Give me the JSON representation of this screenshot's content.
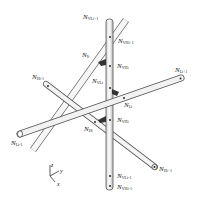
{
  "figure": {
    "type": "3d-woven-lattice-node-diagram",
    "colors": {
      "rod_fill": "#f2f2f2",
      "rod_edge": "#555555",
      "connector": "#333333",
      "node_dot": "#111111",
      "text": "#222222"
    },
    "nodes": [
      {
        "id": "vli_plus",
        "base": "N",
        "sub": "VLi+1"
      },
      {
        "id": "vhi_plus",
        "base": "N",
        "sub": "VHi+1"
      },
      {
        "id": "li",
        "base": "N",
        "sub": "Ii"
      },
      {
        "id": "vhi",
        "base": "N",
        "sub": "VHi"
      },
      {
        "id": "vli",
        "base": "N",
        "sub": "VLi"
      },
      {
        "id": "hi_minus",
        "base": "N",
        "sub": "Hi-1"
      },
      {
        "id": "li_plus",
        "base": "N",
        "sub": "Li+1"
      },
      {
        "id": "lj",
        "base": "N",
        "sub": "Li"
      },
      {
        "id": "vhi_b",
        "base": "N",
        "sub": "VHi"
      },
      {
        "id": "hi",
        "base": "N",
        "sub": "Hi"
      },
      {
        "id": "li_minus",
        "base": "N",
        "sub": "Li-1"
      },
      {
        "id": "hi_plus",
        "base": "N",
        "sub": "Hi+1"
      },
      {
        "id": "vli_minus",
        "base": "N",
        "sub": "VLi-1"
      },
      {
        "id": "vhi_minus",
        "base": "N",
        "sub": "VHi-1"
      }
    ],
    "axes": {
      "z": "z",
      "y": "y",
      "x": "x"
    }
  }
}
